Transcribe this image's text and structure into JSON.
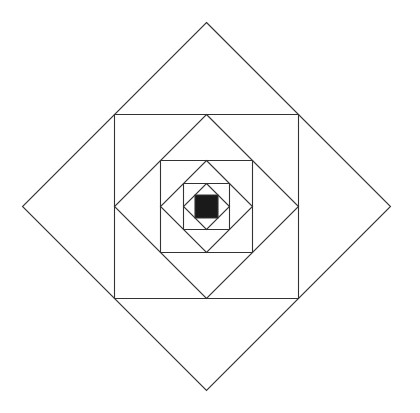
{
  "diagram": {
    "center": [
      206.5,
      206.5
    ],
    "stroke_color": "#333333",
    "stroke_width": 1.1,
    "fill_color": "#1a1a1a",
    "background": "#ffffff",
    "shapes": [
      {
        "id": "diamond-1",
        "kind": "diamond",
        "half": 184,
        "filled": false
      },
      {
        "id": "square-1",
        "kind": "square",
        "half": 92,
        "filled": false
      },
      {
        "id": "diamond-2",
        "kind": "diamond",
        "half": 92,
        "filled": false
      },
      {
        "id": "square-2",
        "kind": "square",
        "half": 46,
        "filled": false
      },
      {
        "id": "diamond-3",
        "kind": "diamond",
        "half": 46,
        "filled": false
      },
      {
        "id": "square-3",
        "kind": "square",
        "half": 23,
        "filled": false
      },
      {
        "id": "diamond-4",
        "kind": "diamond",
        "half": 23,
        "filled": false
      },
      {
        "id": "center-square",
        "kind": "square",
        "half": 11.5,
        "filled": true
      }
    ]
  }
}
